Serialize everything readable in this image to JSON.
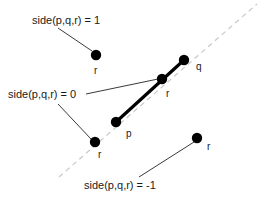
{
  "figure": {
    "width": 266,
    "height": 198,
    "background_color": "#ffffff",
    "colors": {
      "point": "#000000",
      "segment": "#000000",
      "leader": "#3a3a3a",
      "dashed_line": "#c9c9c9",
      "text": "#1a1a1a"
    }
  },
  "labels": {
    "side_positive": "side(p,q,r) = 1",
    "side_zero": "side(p,q,r) = 0",
    "side_negative": "side(p,q,r) = -1"
  },
  "points": [
    {
      "id": "r-above",
      "label": "r",
      "x": 96,
      "y": 55,
      "radius": 5.2
    },
    {
      "id": "r-on-line",
      "label": "r",
      "x": 162,
      "y": 79,
      "radius": 5.2
    },
    {
      "id": "r-on-ray",
      "label": "r",
      "x": 95,
      "y": 142,
      "radius": 5.2
    },
    {
      "id": "r-below",
      "label": "r",
      "x": 197,
      "y": 138,
      "radius": 5.2
    },
    {
      "id": "p",
      "label": "p",
      "x": 116,
      "y": 122,
      "radius": 5.2
    },
    {
      "id": "q",
      "label": "q",
      "x": 184,
      "y": 60,
      "radius": 5.2
    }
  ],
  "point_label_positions": [
    {
      "id": "r-above-label",
      "text": "r",
      "x": 94,
      "y": 74
    },
    {
      "id": "r-on-line-label",
      "text": "r",
      "x": 166,
      "y": 97
    },
    {
      "id": "r-on-ray-label",
      "text": "r",
      "x": 98,
      "y": 158
    },
    {
      "id": "r-below-label",
      "text": "r",
      "x": 207,
      "y": 150
    },
    {
      "id": "p-label",
      "text": "p",
      "x": 126,
      "y": 137
    },
    {
      "id": "q-label",
      "text": "q",
      "x": 196,
      "y": 70
    }
  ],
  "expression_label_positions": [
    {
      "id": "side-positive-label",
      "x": 32,
      "y": 24
    },
    {
      "id": "side-zero-label",
      "x": 8,
      "y": 98
    },
    {
      "id": "side-negative-label",
      "x": 84,
      "y": 189
    }
  ],
  "segment": {
    "name": "pq-segment",
    "from": {
      "x": 116,
      "y": 122
    },
    "to": {
      "x": 184,
      "y": 60
    },
    "stroke_width": 3.2
  },
  "dashed_line": {
    "name": "supporting-line-pq",
    "from": {
      "x": 59,
      "y": 177
    },
    "to": {
      "x": 257,
      "y": 4
    },
    "dash_pattern": "5 4"
  },
  "leaders": [
    {
      "id": "leader-positive",
      "from": {
        "x": 58,
        "y": 28
      },
      "to": {
        "x": 92,
        "y": 51
      }
    },
    {
      "id": "leader-zero-up",
      "from": {
        "x": 86,
        "y": 94
      },
      "to": {
        "x": 158,
        "y": 79
      }
    },
    {
      "id": "leader-zero-down",
      "from": {
        "x": 58,
        "y": 104
      },
      "to": {
        "x": 91,
        "y": 139
      }
    },
    {
      "id": "leader-negative",
      "from": {
        "x": 139,
        "y": 177
      },
      "to": {
        "x": 194,
        "y": 142
      }
    }
  ]
}
